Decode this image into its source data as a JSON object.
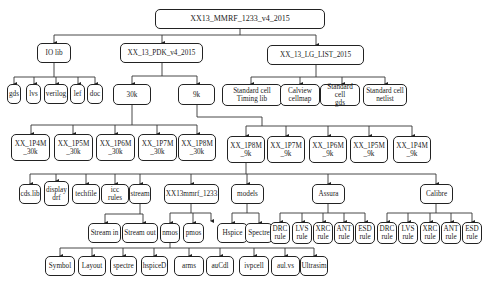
{
  "diagram": {
    "title": "XX13_MMRF_1233_v4_2015",
    "nodes": [
      {
        "id": "root",
        "label": "XX13_MMRF_1233_v4_2015",
        "x": 155,
        "y": 9,
        "w": 170,
        "h": 20
      },
      {
        "id": "iolib",
        "label": "IO lib",
        "x": 37,
        "y": 43,
        "w": 34,
        "h": 20
      },
      {
        "id": "pdk",
        "label": "XX_13_PDK_v4_2015",
        "x": 120,
        "y": 43,
        "w": 83,
        "h": 20
      },
      {
        "id": "lglist",
        "label": "XX_13_LG_LIST_2015",
        "x": 267,
        "y": 45,
        "w": 97,
        "h": 20
      },
      {
        "id": "gds",
        "label": "gds",
        "x": 7,
        "y": 84,
        "w": 14,
        "h": 20
      },
      {
        "id": "lvs",
        "label": "lvs",
        "x": 26,
        "y": 84,
        "w": 15,
        "h": 20
      },
      {
        "id": "verilog",
        "label": "verilog",
        "x": 44,
        "y": 84,
        "w": 24,
        "h": 20
      },
      {
        "id": "lef",
        "label": "lef",
        "x": 70,
        "y": 84,
        "w": 15,
        "h": 20
      },
      {
        "id": "doc",
        "label": "doc",
        "x": 87,
        "y": 84,
        "w": 16,
        "h": 20
      },
      {
        "id": "k30",
        "label": "30k",
        "x": 113,
        "y": 84,
        "w": 38,
        "h": 21
      },
      {
        "id": "k9",
        "label": "9k",
        "x": 178,
        "y": 84,
        "w": 37,
        "h": 21
      },
      {
        "id": "stdtiming",
        "label": "Standard cell\nTiming lib",
        "x": 222,
        "y": 84,
        "w": 60,
        "h": 22
      },
      {
        "id": "calview",
        "label": "Calview\ncellmap",
        "x": 280,
        "y": 84,
        "w": 40,
        "h": 22
      },
      {
        "id": "stdgds",
        "label": "Standard cell\ngds",
        "x": 320,
        "y": 84,
        "w": 40,
        "h": 22
      },
      {
        "id": "stdnetlist",
        "label": "Standard cell\nnetlist",
        "x": 363,
        "y": 84,
        "w": 44,
        "h": 22
      },
      {
        "id": "p1p4m30",
        "label": "XX_1P4M\n_30k",
        "x": 11,
        "y": 134,
        "w": 39,
        "h": 27
      },
      {
        "id": "p1p5m30",
        "label": "XX_1P5M\n_30k",
        "x": 54,
        "y": 134,
        "w": 39,
        "h": 27
      },
      {
        "id": "p1p6m30",
        "label": "XX_1P6M\n_30k",
        "x": 96,
        "y": 134,
        "w": 39,
        "h": 27
      },
      {
        "id": "p1p7m30",
        "label": "XX_1P7M\n_30k",
        "x": 138,
        "y": 134,
        "w": 39,
        "h": 27
      },
      {
        "id": "p1p8m30",
        "label": "XX_1P8M\n_30k",
        "x": 178,
        "y": 134,
        "w": 38,
        "h": 27
      },
      {
        "id": "p1p8m9",
        "label": "XX_1P8M\n_9k",
        "x": 227,
        "y": 136,
        "w": 38,
        "h": 27
      },
      {
        "id": "p1p7m9",
        "label": "XX_1P7M\n_9k",
        "x": 267,
        "y": 136,
        "w": 38,
        "h": 27
      },
      {
        "id": "p1p6m9",
        "label": "XX_1P6M\n_9k",
        "x": 309,
        "y": 136,
        "w": 38,
        "h": 27
      },
      {
        "id": "p1p5m9",
        "label": "XX_1P5M\n_9k",
        "x": 350,
        "y": 136,
        "w": 38,
        "h": 27
      },
      {
        "id": "p1p4m9",
        "label": "XX_1P4M\n_9k",
        "x": 393,
        "y": 136,
        "w": 38,
        "h": 27
      },
      {
        "id": "cdslib",
        "label": "cds.lib",
        "x": 19,
        "y": 184,
        "w": 22,
        "h": 20
      },
      {
        "id": "displaydrf",
        "label": "display\ndrf",
        "x": 44,
        "y": 181,
        "w": 25,
        "h": 25
      },
      {
        "id": "techfile",
        "label": "techfile",
        "x": 72,
        "y": 184,
        "w": 28,
        "h": 20
      },
      {
        "id": "iccrules",
        "label": "icc rules",
        "x": 101,
        "y": 184,
        "w": 28,
        "h": 20
      },
      {
        "id": "stream",
        "label": "stream",
        "x": 129,
        "y": 184,
        "w": 22,
        "h": 20
      },
      {
        "id": "xx13mmrf",
        "label": "XX13mmrf_1233",
        "x": 164,
        "y": 184,
        "w": 55,
        "h": 20
      },
      {
        "id": "models",
        "label": "models",
        "x": 231,
        "y": 184,
        "w": 33,
        "h": 20
      },
      {
        "id": "assura",
        "label": "Assura",
        "x": 312,
        "y": 184,
        "w": 33,
        "h": 20
      },
      {
        "id": "calibre",
        "label": "Calibre",
        "x": 420,
        "y": 184,
        "w": 33,
        "h": 20
      },
      {
        "id": "streamin",
        "label": "Stream in",
        "x": 88,
        "y": 223,
        "w": 33,
        "h": 20
      },
      {
        "id": "streamout",
        "label": "Stream out",
        "x": 122,
        "y": 223,
        "w": 36,
        "h": 20
      },
      {
        "id": "nmos",
        "label": "nmos",
        "x": 160,
        "y": 223,
        "w": 20,
        "h": 20
      },
      {
        "id": "pmos",
        "label": "pmos",
        "x": 183,
        "y": 223,
        "w": 21,
        "h": 20
      },
      {
        "id": "hspice",
        "label": "Hspice",
        "x": 217,
        "y": 223,
        "w": 31,
        "h": 20
      },
      {
        "id": "spectre",
        "label": "Spectre",
        "x": 245,
        "y": 223,
        "w": 28,
        "h": 20
      },
      {
        "id": "assura_drc",
        "label": "DRC\nrule",
        "x": 270,
        "y": 222,
        "w": 20,
        "h": 22
      },
      {
        "id": "assura_lvs",
        "label": "LVS\nrule",
        "x": 292,
        "y": 222,
        "w": 20,
        "h": 22
      },
      {
        "id": "assura_xrc",
        "label": "XRC\nrule",
        "x": 313,
        "y": 222,
        "w": 20,
        "h": 22
      },
      {
        "id": "assura_ant",
        "label": "ANT\nrule",
        "x": 334,
        "y": 222,
        "w": 20,
        "h": 22
      },
      {
        "id": "assura_esd",
        "label": "ESD\nrule",
        "x": 355,
        "y": 222,
        "w": 20,
        "h": 22
      },
      {
        "id": "calibre_drc",
        "label": "DRC\nrule",
        "x": 377,
        "y": 222,
        "w": 20,
        "h": 22
      },
      {
        "id": "calibre_lvs",
        "label": "LVS\nrule",
        "x": 398,
        "y": 222,
        "w": 20,
        "h": 22
      },
      {
        "id": "calibre_xrc",
        "label": "XRC\nrule",
        "x": 420,
        "y": 222,
        "w": 20,
        "h": 22
      },
      {
        "id": "calibre_ant",
        "label": "ANT\nrule",
        "x": 441,
        "y": 222,
        "w": 20,
        "h": 22
      },
      {
        "id": "calibre_esd",
        "label": "ESD\nrule",
        "x": 462,
        "y": 222,
        "w": 20,
        "h": 22
      },
      {
        "id": "symbol",
        "label": "Symbol",
        "x": 45,
        "y": 256,
        "w": 30,
        "h": 20
      },
      {
        "id": "layout",
        "label": "Layout",
        "x": 78,
        "y": 256,
        "w": 28,
        "h": 20
      },
      {
        "id": "spectre2",
        "label": "spectre",
        "x": 110,
        "y": 256,
        "w": 27,
        "h": 20
      },
      {
        "id": "hspiceD",
        "label": "hspiceD",
        "x": 141,
        "y": 256,
        "w": 27,
        "h": 20
      },
      {
        "id": "arms",
        "label": "arms",
        "x": 174,
        "y": 256,
        "w": 30,
        "h": 20
      },
      {
        "id": "aucdl",
        "label": "auCdl",
        "x": 206,
        "y": 256,
        "w": 28,
        "h": 20
      },
      {
        "id": "ivpcell",
        "label": "ivpcell",
        "x": 239,
        "y": 256,
        "w": 30,
        "h": 20
      },
      {
        "id": "aulvs",
        "label": "aul.vs",
        "x": 271,
        "y": 256,
        "w": 29,
        "h": 20
      },
      {
        "id": "ultrasim",
        "label": "Ultrasim",
        "x": 300,
        "y": 256,
        "w": 28,
        "h": 20
      }
    ],
    "colors": {
      "line": "#222222",
      "box_border": "#222222",
      "background": "#ffffff"
    }
  }
}
